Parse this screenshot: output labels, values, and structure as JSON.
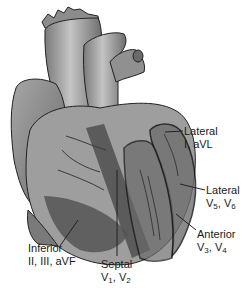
{
  "diagram": {
    "colors": {
      "background": "#ffffff",
      "heart_base": "#8a8a8a",
      "heart_light": "#b8b8b8",
      "heart_dark": "#555555",
      "region_dark": "#4a4a4a",
      "outline": "#111111",
      "text": "#1a1a1a"
    },
    "labels": [
      {
        "id": "lateral-high",
        "title": "Lateral",
        "leads": "I, aVL",
        "leads_parts": [
          [
            "I",
            ""
          ],
          [
            ", aVL",
            ""
          ]
        ]
      },
      {
        "id": "lateral-low",
        "title": "Lateral",
        "leads_parts": [
          [
            "V",
            "5"
          ],
          [
            ", V",
            "6"
          ]
        ]
      },
      {
        "id": "anterior",
        "title": "Anterior",
        "leads_parts": [
          [
            "V",
            "3"
          ],
          [
            ", V",
            "4"
          ]
        ]
      },
      {
        "id": "inferior",
        "title": "Inferior",
        "leads": "II, III, aVF"
      },
      {
        "id": "septal",
        "title": "Septal",
        "leads_parts": [
          [
            "V",
            "1"
          ],
          [
            ", V",
            "2"
          ]
        ]
      }
    ]
  }
}
